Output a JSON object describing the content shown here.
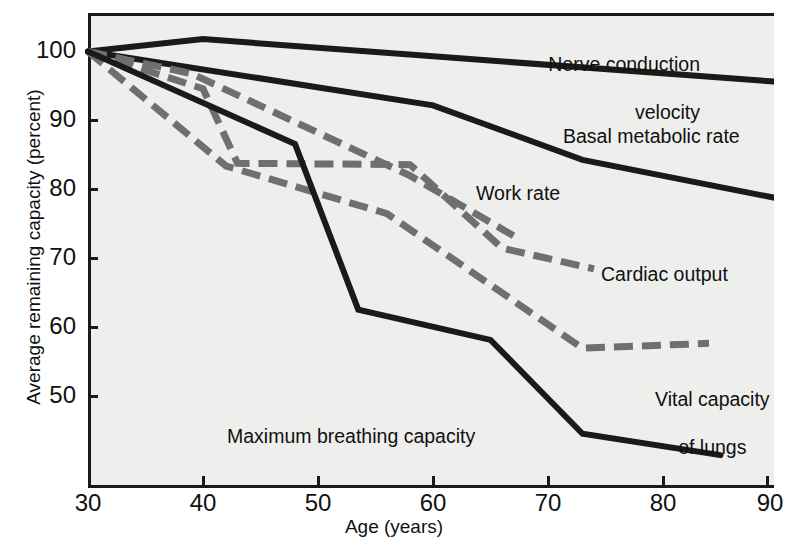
{
  "chart_data": {
    "type": "line",
    "title": "",
    "xlabel": "Age (years)",
    "ylabel": "Average remaining capacity (percent)",
    "xlim": [
      30,
      90
    ],
    "ylim": [
      40,
      104
    ],
    "xticks": [
      30,
      40,
      50,
      60,
      70,
      80,
      90
    ],
    "yticks": [
      50,
      60,
      70,
      80,
      90,
      100
    ],
    "xtick_labels": [
      "30",
      "40",
      "50",
      "60",
      "70",
      "80",
      "90"
    ],
    "ytick_labels": [
      "50",
      "60",
      "70",
      "80",
      "90",
      "100"
    ],
    "grid": false,
    "legend": "inline-annotations",
    "colors": {
      "solid_line": "#1a1a1a",
      "dashed_line": "#6f6f6f",
      "plot_background": "#eeeeec",
      "axis": "#1a1a1a",
      "text": "#111111"
    },
    "series": [
      {
        "name": "Nerve conduction velocity",
        "style": "solid",
        "color": "#1a1a1a",
        "x": [
          30,
          40,
          60,
          90
        ],
        "y": [
          100,
          101.8,
          99.3,
          95.6
        ]
      },
      {
        "name": "Basal metabolic rate",
        "style": "solid",
        "color": "#1a1a1a",
        "x": [
          30,
          60,
          73,
          90
        ],
        "y": [
          100,
          92.2,
          84.3,
          78.7
        ]
      },
      {
        "name": "Work rate",
        "style": "dashed",
        "color": "#6f6f6f",
        "x": [
          30,
          39,
          58,
          67
        ],
        "y": [
          100,
          96.8,
          82.0,
          73.3
        ]
      },
      {
        "name": "Cardiac output",
        "style": "dashed",
        "color": "#6f6f6f",
        "x": [
          30,
          40,
          43,
          58,
          66,
          74
        ],
        "y": [
          100,
          94.6,
          83.8,
          83.6,
          71.5,
          68.5
        ]
      },
      {
        "name": "Vital capacity of lungs",
        "style": "dashed",
        "color": "#6f6f6f",
        "x": [
          30,
          42,
          56,
          73,
          84
        ],
        "y": [
          100,
          83.4,
          76.5,
          57.0,
          57.7
        ]
      },
      {
        "name": "Maximum breathing capacity",
        "style": "solid",
        "color": "#1a1a1a",
        "x": [
          30,
          48,
          53.5,
          65,
          73,
          85
        ],
        "y": [
          100,
          86.6,
          62.6,
          58.2,
          44.6,
          41.5
        ]
      }
    ],
    "annotations": [
      {
        "key": "nerve",
        "text": "Nerve conduction\nvelocity"
      },
      {
        "key": "basal",
        "text": "Basal metabolic rate"
      },
      {
        "key": "work",
        "text": "Work rate"
      },
      {
        "key": "cardiac",
        "text": "Cardiac output"
      },
      {
        "key": "vital",
        "text": "Vital capacity\nof lungs"
      },
      {
        "key": "breathing",
        "text": "Maximum breathing capacity"
      }
    ]
  },
  "axes": {
    "y_title": "Average remaining capacity (percent)",
    "x_title": "Age (years)",
    "y_ticks": [
      "100",
      "90",
      "80",
      "70",
      "60",
      "50"
    ],
    "x_ticks": [
      "30",
      "40",
      "50",
      "60",
      "70",
      "80",
      "90"
    ]
  },
  "labels": {
    "nerve_line1": "Nerve conduction",
    "nerve_line2": "velocity",
    "basal": "Basal metabolic rate",
    "work": "Work rate",
    "cardiac": "Cardiac output",
    "vital_line1": "Vital capacity",
    "vital_line2": "of lungs",
    "breathing": "Maximum breathing capacity"
  }
}
